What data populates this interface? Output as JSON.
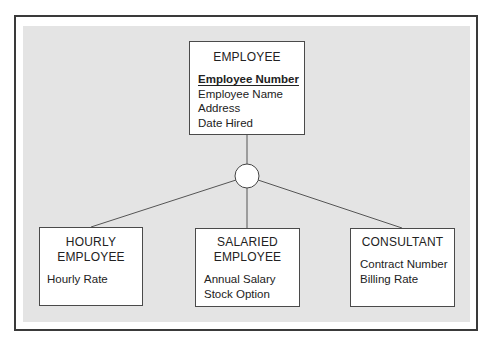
{
  "diagram": {
    "type": "EER supertype/subtype hierarchy",
    "supertype": {
      "name": "EMPLOYEE",
      "identifier": "Employee Number",
      "attributes": [
        "Employee Name",
        "Address",
        "Date Hired"
      ]
    },
    "subtypes": [
      {
        "name_line1": "HOURLY",
        "name_line2": "EMPLOYEE",
        "attributes": [
          "Hourly Rate"
        ]
      },
      {
        "name_line1": "SALARIED",
        "name_line2": "EMPLOYEE",
        "attributes": [
          "Annual Salary",
          "Stock Option"
        ]
      },
      {
        "name_line1": "CONSULTANT",
        "name_line2": "",
        "attributes": [
          "Contract Number",
          "Billing Rate"
        ]
      }
    ],
    "connector": "circle",
    "colors": {
      "panel": "#e4e4e4",
      "frame": "#3a3a3a",
      "box_border": "#4a4a4a",
      "line": "#555555"
    }
  }
}
